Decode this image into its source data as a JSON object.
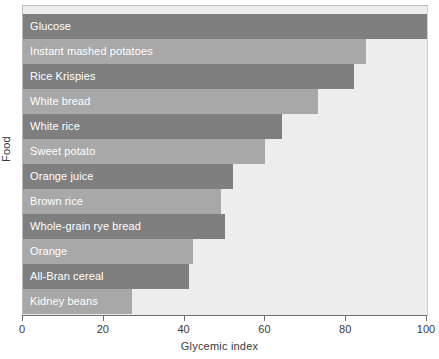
{
  "chart_data": {
    "type": "bar",
    "orientation": "horizontal",
    "title": "",
    "xlabel": "Glycemic index",
    "ylabel": "Food",
    "xlim": [
      0,
      100
    ],
    "xticks": [
      0,
      20,
      40,
      60,
      80,
      100
    ],
    "xticklabels": [
      "0",
      "20",
      "40",
      "60",
      "80",
      "100"
    ],
    "grid": false,
    "legend": null,
    "categories": [
      "Glucose",
      "Instant mashed potatoes",
      "Rice Krispies",
      "White bread",
      "White rice",
      "Sweet potato",
      "Orange juice",
      "Brown rice",
      "Whole-grain rye bread",
      "Orange",
      "All-Bran cereal",
      "Kidney beans"
    ],
    "values": [
      100,
      85,
      82,
      73,
      64,
      60,
      52,
      49,
      50,
      42,
      41,
      27
    ],
    "bars": [
      {
        "label": "Glucose",
        "value": 100,
        "shade": "dark"
      },
      {
        "label": "Instant mashed potatoes",
        "value": 85,
        "shade": "light"
      },
      {
        "label": "Rice Krispies",
        "value": 82,
        "shade": "dark"
      },
      {
        "label": "White bread",
        "value": 73,
        "shade": "light"
      },
      {
        "label": "White rice",
        "value": 64,
        "shade": "dark"
      },
      {
        "label": "Sweet potato",
        "value": 60,
        "shade": "light"
      },
      {
        "label": "Orange juice",
        "value": 52,
        "shade": "dark"
      },
      {
        "label": "Brown rice",
        "value": 49,
        "shade": "light"
      },
      {
        "label": "Whole-grain rye bread",
        "value": 50,
        "shade": "dark"
      },
      {
        "label": "Orange",
        "value": 42,
        "shade": "light"
      },
      {
        "label": "All-Bran cereal",
        "value": 41,
        "shade": "dark"
      },
      {
        "label": "Kidney beans",
        "value": 27,
        "shade": "light"
      }
    ],
    "colors": {
      "bar_dark": "#7f7f7f",
      "bar_light": "#a8a8a8",
      "plot_background": "#ededed",
      "figure_background": "#ffffff",
      "axis_line": "#6e6e6e",
      "bar_label_text": "#ffffff",
      "axis_text": "#3a3a3a"
    }
  }
}
